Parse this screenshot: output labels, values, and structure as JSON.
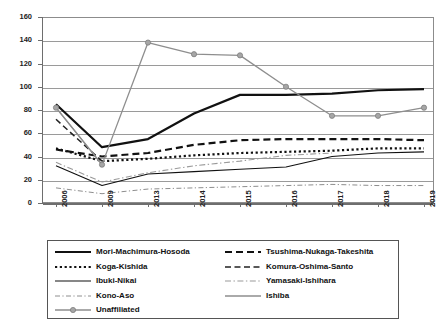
{
  "top_artifact": "",
  "chart_data": {
    "type": "line",
    "title": "",
    "subtitle": "",
    "xlabel": "",
    "ylabel": "",
    "categories": [
      "2006",
      "2009",
      "2013",
      "2014",
      "2015",
      "2016",
      "2017",
      "2018",
      "2019"
    ],
    "x": [
      2006,
      2009,
      2013,
      2014,
      2015,
      2016,
      2017,
      2018,
      2019
    ],
    "ylim": [
      0,
      160
    ],
    "yticks": [
      0,
      20,
      40,
      60,
      80,
      100,
      120,
      140,
      160
    ],
    "grid": true,
    "legend_position": "bottom",
    "series": [
      {
        "name": "Mori-Machimura-Hosoda",
        "style": "solid-thick",
        "color": "#111111",
        "values": [
          85,
          48,
          55,
          77,
          93,
          93,
          94,
          97,
          98
        ]
      },
      {
        "name": "Tsushima-Nukaga-Takeshita",
        "style": "dashed-thick",
        "color": "#111111",
        "values": [
          46,
          40,
          43,
          50,
          54,
          55,
          55,
          55,
          54
        ]
      },
      {
        "name": "Koga-Kishida",
        "style": "dotted-thick",
        "color": "#111111",
        "values": [
          47,
          36,
          38,
          41,
          43,
          44,
          45,
          47,
          47
        ]
      },
      {
        "name": "Komura-Oshima-Santo",
        "style": "dashed-medium",
        "color": "#222222",
        "values": [
          72,
          36,
          null,
          null,
          null,
          null,
          null,
          null,
          null
        ]
      },
      {
        "name": "Ibuki-Nikai",
        "style": "solid-thin",
        "color": "#111111",
        "values": [
          32,
          15,
          25,
          27,
          29,
          31,
          40,
          43,
          44
        ]
      },
      {
        "name": "Yamasaki-Ishihara",
        "style": "dashdot-gray",
        "color": "#9a9a9a",
        "values": [
          35,
          18,
          26,
          32,
          36,
          41,
          43,
          null,
          null
        ]
      },
      {
        "name": "Kono-Aso",
        "style": "dashdot-thin-gray",
        "color": "#8e8e8e",
        "values": [
          13,
          8,
          12,
          13,
          14,
          15,
          16,
          15,
          15
        ]
      },
      {
        "name": "Ishiba",
        "style": "solid-gray",
        "color": "#8e8e8e",
        "values": [
          82,
          33,
          null,
          null,
          null,
          null,
          null,
          null,
          null
        ]
      },
      {
        "name": "Unaffiliated",
        "style": "solid-gray-marker",
        "color": "#8e8e8e",
        "markers": true,
        "values": [
          82,
          33,
          138,
          128,
          127,
          100,
          75,
          75,
          82
        ]
      }
    ]
  },
  "legend": {
    "left_column": [
      {
        "label": "Mori-Machimura-Hosoda",
        "style": "solid-thick",
        "color": "#111111"
      },
      {
        "label": "Koga-Kishida",
        "style": "dotted-thick",
        "color": "#111111"
      },
      {
        "label": "Ibuki-Nikai",
        "style": "solid-thin",
        "color": "#111111"
      },
      {
        "label": "Kono-Aso",
        "style": "dashdot-thin-gray",
        "color": "#8e8e8e"
      },
      {
        "label": "Unaffiliated",
        "style": "solid-gray-marker",
        "color": "#8e8e8e"
      }
    ],
    "right_column": [
      {
        "label": "Tsushima-Nukaga-Takeshita",
        "style": "dashed-thick",
        "color": "#111111"
      },
      {
        "label": "Komura-Oshima-Santo",
        "style": "dashed-medium",
        "color": "#222222"
      },
      {
        "label": "Yamasaki-Ishihara",
        "style": "dashdot-gray",
        "color": "#9a9a9a"
      },
      {
        "label": "Ishiba",
        "style": "solid-gray",
        "color": "#8e8e8e"
      }
    ]
  }
}
